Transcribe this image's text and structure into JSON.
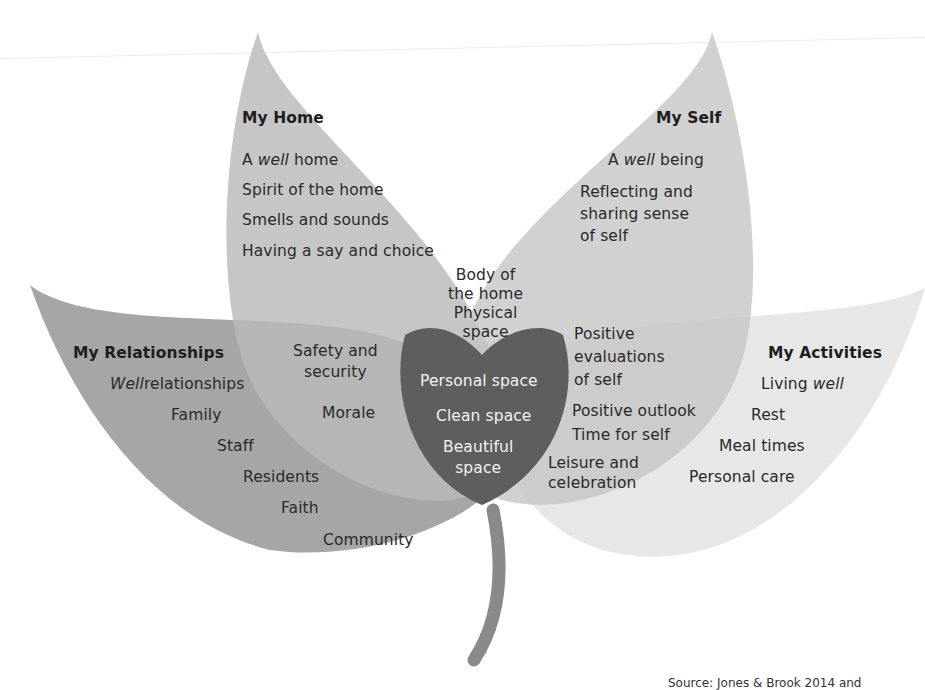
{
  "diagram": {
    "type": "four-leaf overlapping venn",
    "colors": {
      "home_leaf": "#bdbdbd",
      "self_leaf": "#c6c6c6",
      "relationships_leaf": "#9e9e9e",
      "activities_leaf": "#e6e6e6",
      "center_overlap": "#5e5e5e",
      "upper_overlap": "#9a9a9a",
      "stem": "#8a8a8a"
    },
    "leaves": {
      "home": {
        "title": "My Home",
        "items": [
          {
            "pre": "A ",
            "em": "well",
            "post": " home"
          },
          "Spirit of the home",
          "Smells and sounds",
          "Having a say and choice"
        ]
      },
      "self": {
        "title": "My Self",
        "items": [
          {
            "pre": "A ",
            "em": "well",
            "post": " being"
          },
          "Reflecting and\nsharing sense\nof self"
        ]
      },
      "relationships": {
        "title": "My Relationships",
        "items": [
          {
            "pre": "",
            "em": "Well",
            "post": "relationships"
          },
          "Family",
          "Staff",
          "Residents",
          "Faith",
          "Community"
        ]
      },
      "activities": {
        "title": "My Activities",
        "items": [
          {
            "pre": "Living ",
            "em": "well",
            "post": ""
          },
          "Rest",
          "Meal times",
          "Personal care"
        ]
      }
    },
    "overlaps": {
      "home_self": "Body of\nthe home\nPhysical\nspace",
      "home_relationships": [
        "Safety and\nsecurity",
        "Morale"
      ],
      "self_activities": [
        "Positive\nevaluations\nof self",
        "Positive outlook",
        "Time for self",
        "Leisure and\ncelebration"
      ],
      "center": [
        "Personal space",
        "Clean space",
        "Beautiful\nspace"
      ]
    },
    "caption": "Source: Jones & Brook 2014 and"
  }
}
